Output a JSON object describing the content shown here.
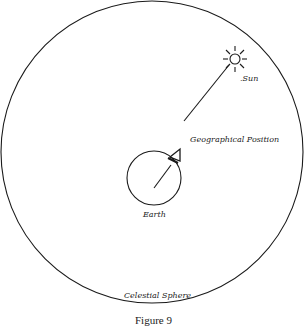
{
  "figure": {
    "caption": "Figure 9",
    "labels": {
      "sun": ".Sun",
      "geographical_position": "Geographical Position",
      "earth": "Earth",
      "celestial_sphere": "Celestial Sphere"
    },
    "elements": {
      "celestial_sphere": {
        "cx": 152,
        "cy": 152,
        "r": 151
      },
      "earth": {
        "cx": 154,
        "cy": 178,
        "r": 27
      },
      "sun": {
        "cx": 235,
        "cy": 59,
        "r": 5
      },
      "ray": {
        "from": [
          184,
          120
        ],
        "to": [
          231,
          63
        ]
      },
      "radius_line": {
        "from": [
          154,
          185
        ],
        "to": [
          172,
          162
        ]
      }
    },
    "stroke_color": "#1a1a1a"
  }
}
